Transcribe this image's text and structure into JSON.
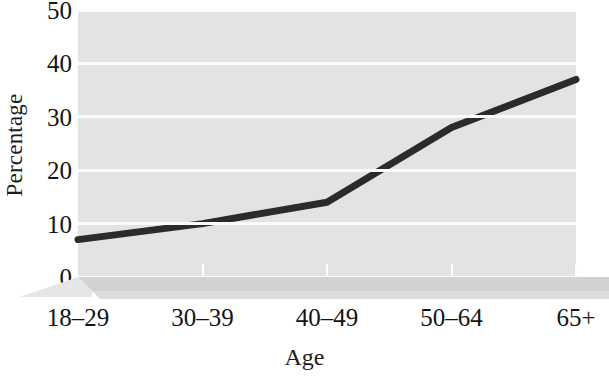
{
  "chart_data": {
    "type": "line",
    "title": "",
    "xlabel": "Age",
    "ylabel": "Percentage",
    "categories": [
      "18–29",
      "30–39",
      "40–49",
      "50–64",
      "65+"
    ],
    "values": [
      7,
      10,
      14,
      28,
      37
    ],
    "series": [
      {
        "name": "Percentage",
        "values": [
          7,
          10,
          14,
          28,
          37
        ]
      }
    ],
    "ylim": [
      0,
      50
    ],
    "yticks": [
      0,
      10,
      20,
      30,
      40,
      50
    ],
    "ytick_labels": [
      "0",
      "10",
      "20",
      "30",
      "40",
      "50"
    ],
    "grid": true,
    "legend": "none",
    "colors": {
      "line": "#2b2b2b",
      "plot_background": "#e3e3e3",
      "gridline": "#fbfbfb",
      "floor": "#d0d0d0",
      "text": "#141414"
    }
  }
}
